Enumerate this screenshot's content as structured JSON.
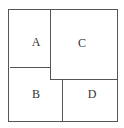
{
  "diagram": {
    "type": "region-partition",
    "line_color": "#555555",
    "text_color": "#333333",
    "regions": [
      {
        "id": "A",
        "label": "A",
        "x": 36,
        "y": 41
      },
      {
        "id": "B",
        "label": "B",
        "x": 36,
        "y": 94
      },
      {
        "id": "C",
        "label": "C",
        "x": 82,
        "y": 43
      },
      {
        "id": "D",
        "label": "D",
        "x": 92,
        "y": 94
      }
    ]
  }
}
